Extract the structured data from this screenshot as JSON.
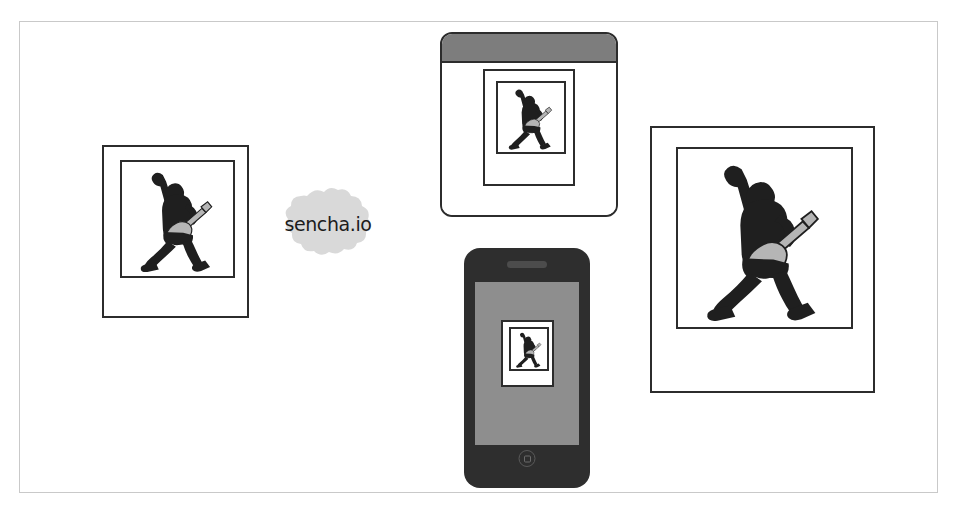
{
  "figure": {
    "caption": "",
    "background_color": "#ffffff",
    "border_color": "#c9c9c9"
  },
  "cloud": {
    "label": "sencha.io",
    "name": "sencha-io-cloud",
    "fill_color": "#d9d9d9",
    "text_color": "#1c1c1c"
  },
  "nodes": [
    {
      "id": "framed-photo-left",
      "type": "picture-frame",
      "label": "Framed guitarist photo (small)",
      "artwork": "guitarist-silhouette"
    },
    {
      "id": "desktop-browser-window",
      "type": "browser-window",
      "label": "Desktop browser window showing guitarist photo",
      "titlebar_color": "#7d7d7d",
      "artwork": "guitarist-silhouette"
    },
    {
      "id": "smartphone",
      "type": "mobile-device",
      "label": "Smartphone showing guitarist photo",
      "body_color": "#2e2e2e",
      "screen_color": "#8e8e8e",
      "artwork": "guitarist-silhouette"
    },
    {
      "id": "framed-photo-right",
      "type": "picture-frame",
      "label": "Framed guitarist photo (large)",
      "artwork": "guitarist-silhouette"
    }
  ],
  "artwork": {
    "guitarist-silhouette": {
      "name": "guitarist-silhouette",
      "body_color": "#1f1f1f",
      "guitar_color": "#b5b5b5"
    }
  }
}
